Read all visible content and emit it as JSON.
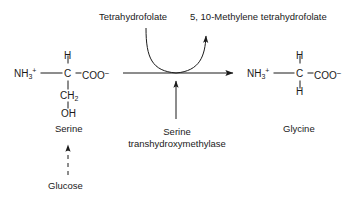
{
  "figure": {
    "background_color": "#ffffff",
    "ink_color": "#1a1a1a"
  },
  "reactant": {
    "name": "Serine",
    "amino_group": "NH",
    "amino_sub": "3",
    "amino_charge": "+",
    "alpha_carbon": "C",
    "alpha_hydrogen": "H",
    "carboxyl": "COO",
    "carboxyl_charge": "−",
    "side_chain_ch2": "CH",
    "side_chain_ch2_sub": "2",
    "side_chain_oh": "OH"
  },
  "product": {
    "name": "Glycine",
    "amino_group": "NH",
    "amino_sub": "3",
    "amino_charge": "+",
    "alpha_carbon": "C",
    "hydrogen_top": "H",
    "hydrogen_bottom": "H",
    "carboxyl": "COO",
    "carboxyl_charge": "−"
  },
  "cofactor": {
    "input_label": "Tetrahydrofolate",
    "output_label": "5, 10-Methylene tetrahydrofolate"
  },
  "enzyme": {
    "line1": "Serine",
    "line2": "transhydroxymethylase"
  },
  "precursor": {
    "label": "Glucose",
    "arrow_style": "dashed"
  },
  "arrows": {
    "main_reaction": "right-arrow",
    "cofactor_curve": "curved-arrow",
    "enzyme_pointer": "up-arrow",
    "precursor_pointer": "dashed-up-arrow"
  }
}
